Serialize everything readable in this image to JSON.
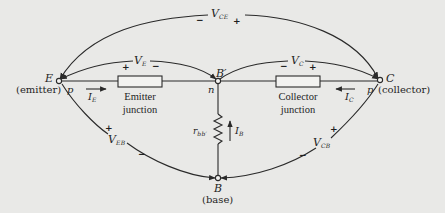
{
  "figure": {
    "type": "transistor-junction-equivalent-circuit",
    "colors": {
      "background": "#e9e9e7",
      "line": "#2a2a2a"
    }
  },
  "nodes": {
    "emitter": {
      "letter": "E",
      "name": "(emitter)",
      "region": "p"
    },
    "collector": {
      "letter": "C",
      "name": "(collector)",
      "region": "p"
    },
    "base_internal": {
      "letter": "B",
      "prime": "′",
      "region": "n"
    },
    "base": {
      "letter": "B",
      "name": "(base)"
    }
  },
  "components": {
    "emitter_junction": {
      "line1": "Emitter",
      "line2": "junction"
    },
    "collector_junction": {
      "line1": "Collector",
      "line2": "junction"
    },
    "base_resistor": {
      "symbol": "r",
      "subscript": "bb′"
    }
  },
  "currents": {
    "emitter": {
      "symbol": "I",
      "subscript": "E"
    },
    "collector": {
      "symbol": "I",
      "subscript": "C"
    },
    "base": {
      "symbol": "I",
      "subscript": "B"
    }
  },
  "voltages": {
    "vce": {
      "symbol": "V",
      "subscript": "CE",
      "minus": "−",
      "plus": "+"
    },
    "ve": {
      "symbol": "V",
      "subscript": "E",
      "plus": "+",
      "minus": "−"
    },
    "vc": {
      "symbol": "V",
      "subscript": "C",
      "minus": "−",
      "plus": "+"
    },
    "veb": {
      "symbol": "V",
      "subscript": "EB",
      "plus": "+",
      "minus": "−"
    },
    "vcb": {
      "symbol": "V",
      "subscript": "CB",
      "plus": "+",
      "minus": "−"
    }
  }
}
